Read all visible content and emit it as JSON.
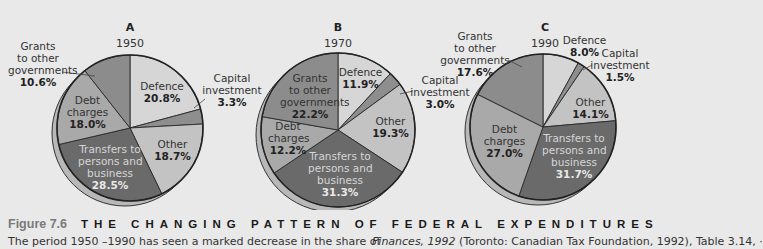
{
  "figure": {
    "number": "Figure 7.6",
    "title": "THE CHANGING PATTERN OF FEDERAL EXPENDITURES",
    "caption_left": "The period 1950 –1990 has seen a marked decrease in the share of",
    "caption_right_italic": "Finances, 1992",
    "caption_right": " (Toronto: Canadian Tax Foundation, 1992), Table 3.14, ·"
  },
  "colors": {
    "defence": "#d6d6d6",
    "capital": "#8e8e8e",
    "other": "#c3c3c3",
    "transfers": "#6a6a6a",
    "debt": "#a9a9a9",
    "grants": "#8c8c8c",
    "rim": "#b8b8b8",
    "background": "#e9e9e9"
  },
  "chart_data": [
    {
      "type": "pie",
      "title": "A",
      "subtitle": "1950",
      "categories": [
        "Defence",
        "Capital investment",
        "Other",
        "Transfers to persons and business",
        "Debt charges",
        "Grants to other governments"
      ],
      "values": [
        20.8,
        3.3,
        18.7,
        28.5,
        18.0,
        10.6
      ],
      "labels": [
        "20.8%",
        "3.3%",
        "18.7%",
        "28.5%",
        "18.0%",
        "10.6%"
      ]
    },
    {
      "type": "pie",
      "title": "B",
      "subtitle": "1970",
      "categories": [
        "Defence",
        "Capital investment",
        "Other",
        "Transfers to persons and business",
        "Debt charges",
        "Grants to other governments"
      ],
      "values": [
        11.9,
        3.0,
        19.3,
        31.3,
        12.2,
        22.2
      ],
      "labels": [
        "11.9%",
        "3.0%",
        "19.3%",
        "31.3%",
        "12.2%",
        "22.2%"
      ]
    },
    {
      "type": "pie",
      "title": "C",
      "subtitle": "1990",
      "categories": [
        "Defence",
        "Capital investment",
        "Other",
        "Transfers to persons and business",
        "Debt charges",
        "Grants to other governments"
      ],
      "values": [
        8.0,
        1.5,
        14.1,
        31.7,
        27.0,
        17.6
      ],
      "labels": [
        "8.0%",
        "1.5%",
        "14.1%",
        "31.7%",
        "27.0%",
        "17.6%"
      ]
    }
  ],
  "pies": [
    {
      "letter": "A",
      "year": "1950",
      "labels": {
        "defence": {
          "name": "Defence",
          "value": "20.8%"
        },
        "capital": {
          "name1": "Capital",
          "name2": "investment",
          "value": "3.3%"
        },
        "other": {
          "name": "Other",
          "value": "18.7%"
        },
        "transfers": {
          "name1": "Transfers to",
          "name2": "persons and",
          "name3": "business",
          "value": "28.5%"
        },
        "debt": {
          "name1": "Debt",
          "name2": "charges",
          "value": "18.0%"
        },
        "grants": {
          "name1": "Grants",
          "name2": "to other",
          "name3": "governments",
          "value": "10.6%"
        }
      }
    },
    {
      "letter": "B",
      "year": "1970",
      "labels": {
        "defence": {
          "name": "Defence",
          "value": "11.9%"
        },
        "capital": {
          "name1": "Capital",
          "name2": "investment",
          "value": "3.0%"
        },
        "other": {
          "name": "Other",
          "value": "19.3%"
        },
        "transfers": {
          "name1": "Transfers to",
          "name2": "persons and",
          "name3": "business",
          "value": "31.3%"
        },
        "debt": {
          "name1": "Debt",
          "name2": "charges",
          "value": "12.2%"
        },
        "grants": {
          "name1": "Grants",
          "name2": "to other",
          "name3": "governments",
          "value": "22.2%"
        }
      }
    },
    {
      "letter": "C",
      "year": "1990",
      "labels": {
        "defence": {
          "name": "Defence",
          "value": "8.0%"
        },
        "capital": {
          "name1": "Capital",
          "name2": "investment",
          "value": "1.5%"
        },
        "other": {
          "name": "Other",
          "value": "14.1%"
        },
        "transfers": {
          "name1": "Transfers to",
          "name2": "persons and",
          "name3": "business",
          "value": "31.7%"
        },
        "debt": {
          "name1": "Debt",
          "name2": "charges",
          "value": "27.0%"
        },
        "grants": {
          "name1": "Grants",
          "name2": "to other",
          "name3": "governments",
          "value": "17.6%"
        }
      }
    }
  ]
}
